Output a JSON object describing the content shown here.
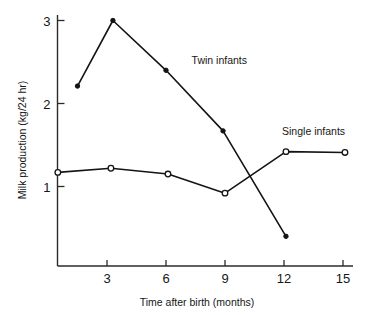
{
  "chart_data": {
    "type": "line",
    "title": "",
    "xlabel": "Time after birth (months)",
    "ylabel": "Milk production (kg/24 hr)",
    "xlim": [
      0,
      15.8
    ],
    "ylim": [
      0.1,
      3.15
    ],
    "xticks": [
      3,
      6,
      9,
      12,
      15
    ],
    "xtick_labels": [
      "3",
      "6",
      "9",
      "12",
      "15"
    ],
    "yticks": [
      1,
      2,
      3
    ],
    "ytick_labels": [
      "1",
      "2",
      "3"
    ],
    "grid": false,
    "legend_position": "inline-annotations",
    "series": [
      {
        "name": "Twin infants",
        "marker": "filled-circle",
        "x": [
          1.5,
          3.3,
          6.0,
          8.9,
          12.1
        ],
        "values": [
          2.21,
          3.0,
          2.4,
          1.67,
          0.4
        ],
        "annotation": "Twin infants",
        "annotation_x": 7.3,
        "annotation_y": 2.47
      },
      {
        "name": "Single infants",
        "marker": "open-circle",
        "x": [
          0.5,
          3.2,
          6.1,
          9.0,
          12.1,
          15.1
        ],
        "values": [
          1.17,
          1.22,
          1.15,
          0.92,
          1.42,
          1.41
        ],
        "annotation": "Single infants",
        "annotation_x": 11.9,
        "annotation_y": 1.62
      }
    ]
  },
  "axes": {
    "x_title": "Time after birth (months)",
    "y_title": "Milk production (kg/24 hr)"
  },
  "colors": {
    "ink": "#141414",
    "background": "#ffffff"
  }
}
